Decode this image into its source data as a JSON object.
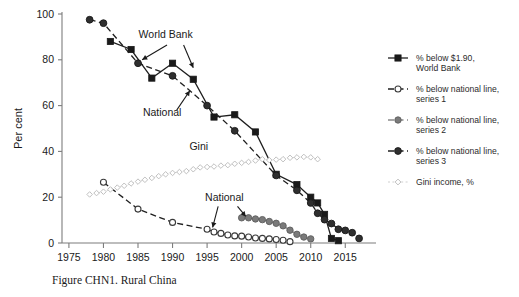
{
  "figure": {
    "caption": "Figure CHN1. Rural China"
  },
  "chart_data": {
    "type": "line",
    "title": "",
    "xlabel": "",
    "ylabel": "Per cent",
    "xlim": [
      1974,
      2018
    ],
    "ylim": [
      0,
      100
    ],
    "xticks": [
      1975,
      1980,
      1985,
      1990,
      1995,
      2000,
      2005,
      2010,
      2015
    ],
    "yticks": [
      0,
      20,
      40,
      60,
      80,
      100
    ],
    "grid": false,
    "legend_position": "right",
    "series": [
      {
        "name": "% below $1.90, World Bank",
        "key": "world_bank",
        "marker": "square-filled",
        "color": "#1a1a1a",
        "linestyle": "solid",
        "x": [
          1981,
          1984,
          1987,
          1990,
          1993,
          1996,
          1999,
          2002,
          2005,
          2008,
          2010,
          2011,
          2012,
          2013,
          2014
        ],
        "y": [
          88,
          84.5,
          72,
          78.5,
          71.5,
          55,
          56,
          48.5,
          30,
          25.5,
          20,
          17.5,
          12.5,
          2,
          1
        ]
      },
      {
        "name": "% below national line, series 1",
        "key": "national_1",
        "marker": "circle-open",
        "color": "#2b2b2b",
        "linestyle": "dashed",
        "x": [
          1980,
          1985,
          1990,
          1995,
          1996,
          1997,
          1998,
          1999,
          2000,
          2001,
          2002,
          2003,
          2004,
          2005,
          2006,
          2007
        ],
        "y": [
          26.5,
          14.8,
          9,
          6,
          4.8,
          4.2,
          3.5,
          3.1,
          3.0,
          2.6,
          2.2,
          2.0,
          1.8,
          1.5,
          1.2,
          0.6
        ]
      },
      {
        "name": "% below national line, series 2",
        "key": "national_2",
        "marker": "circle-grey",
        "color": "#6e6e6e",
        "linestyle": "solid",
        "x": [
          2000,
          2001,
          2002,
          2003,
          2004,
          2005,
          2006,
          2007,
          2008,
          2009,
          2010
        ],
        "y": [
          11,
          11,
          10.5,
          10.2,
          9.4,
          8.6,
          7.5,
          5.6,
          3.8,
          2.6,
          1.8
        ]
      },
      {
        "name": "% below national line, series 3",
        "key": "national_3",
        "marker": "circle-filled",
        "color": "#1a1a1a",
        "linestyle": "dashed",
        "x": [
          1978,
          1980,
          1985,
          1990,
          1995,
          1999,
          2005,
          2008,
          2010,
          2011,
          2012,
          2013,
          2014,
          2015,
          2016,
          2017
        ],
        "y": [
          97.5,
          96,
          78.5,
          73,
          60,
          49,
          29.5,
          23,
          17.5,
          13,
          10.2,
          8.5,
          6,
          5.5,
          4.5,
          2
        ]
      },
      {
        "name": "Gini income, %",
        "key": "gini",
        "marker": "diamond-open",
        "color": "#c3c3c3",
        "linestyle": "dotted",
        "x": [
          1978,
          1979,
          1980,
          1981,
          1982,
          1983,
          1984,
          1985,
          1986,
          1987,
          1988,
          1989,
          1990,
          1991,
          1992,
          1993,
          1994,
          1995,
          1996,
          1997,
          1998,
          1999,
          2000,
          2001,
          2002,
          2003,
          2004,
          2005,
          2006,
          2007,
          2008,
          2009,
          2010,
          2011
        ],
        "y": [
          21.2,
          21.8,
          22.4,
          23.4,
          24.2,
          25.0,
          26.0,
          26.8,
          27.6,
          28.4,
          29.2,
          30.0,
          30.6,
          31.0,
          31.4,
          32.2,
          33.0,
          33.2,
          33.4,
          33.8,
          34.0,
          34.6,
          35.0,
          35.4,
          36.0,
          36.6,
          36.2,
          36.4,
          36.6,
          37.2,
          37.4,
          37.6,
          37.4,
          36.6
        ]
      }
    ],
    "annotations": [
      {
        "id": "world-bank",
        "text": "World Bank",
        "x": 1989.0,
        "y": 89.5
      },
      {
        "id": "national-upper",
        "text": "National",
        "x": 1988.5,
        "y": 55.5
      },
      {
        "id": "gini",
        "text": "Gini",
        "x": 1993.8,
        "y": 40.5
      },
      {
        "id": "national-lower",
        "text": "National",
        "x": 1997.5,
        "y": 18.5
      }
    ]
  },
  "legend": {
    "items": [
      {
        "label_line1": "% below $1.90,",
        "label_line2": "World Bank",
        "marker": "square-filled",
        "color": "#1a1a1a",
        "linestyle": "solid"
      },
      {
        "label_line1": "% below national line,",
        "label_line2": "series 1",
        "marker": "circle-open",
        "color": "#2b2b2b",
        "linestyle": "dashed"
      },
      {
        "label_line1": "% below national line,",
        "label_line2": "series 2",
        "marker": "circle-grey",
        "color": "#6e6e6e",
        "linestyle": "dashed"
      },
      {
        "label_line1": "% below national line,",
        "label_line2": "series 3",
        "marker": "circle-filled",
        "color": "#1a1a1a",
        "linestyle": "dashed"
      },
      {
        "label_line1": "Gini income, %",
        "label_line2": "",
        "marker": "diamond-open",
        "color": "#c3c3c3",
        "linestyle": "dotted"
      }
    ]
  }
}
